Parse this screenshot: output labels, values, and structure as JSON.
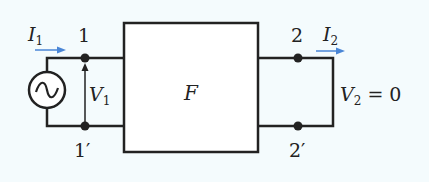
{
  "diagram": {
    "type": "two-port network, output short-circuited",
    "block_label": "F",
    "source": "ac-voltage-source",
    "ports": {
      "input_top": "1",
      "input_bottom": "1′",
      "output_top": "2",
      "output_bottom": "2′"
    },
    "currents": {
      "input": {
        "symbol": "I",
        "sub": "1"
      },
      "output": {
        "symbol": "I",
        "sub": "2"
      }
    },
    "voltages": {
      "input": {
        "symbol": "V",
        "sub": "1"
      },
      "output": {
        "symbol": "V",
        "sub": "2",
        "suffix": " = 0"
      }
    },
    "colors": {
      "background": "#f4fbfd",
      "wire": "#222222",
      "current_arrow": "#4a86d6",
      "block_fill": "#ffffff"
    }
  }
}
